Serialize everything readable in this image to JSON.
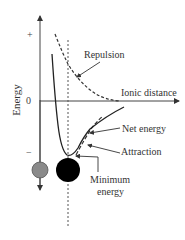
{
  "diagram": {
    "y_axis_label": "Energy",
    "x_axis_label": "Ionic distance",
    "ticks": {
      "plus": "+",
      "zero": "0",
      "minus": "−"
    },
    "labels": {
      "repulsion": "Repulsion",
      "net_energy": "Net energy",
      "attraction": "Attraction",
      "minimum_energy_line1": "Minimum",
      "minimum_energy_line2": "energy"
    },
    "curves": [
      {
        "name": "Net energy",
        "style": "solid"
      },
      {
        "name": "Repulsion",
        "style": "dashed"
      },
      {
        "name": "Attraction",
        "style": "dashed"
      }
    ],
    "ions": [
      {
        "name": "small ion",
        "color": "#8a8a8a"
      },
      {
        "name": "large ion",
        "color": "#000000"
      }
    ]
  }
}
